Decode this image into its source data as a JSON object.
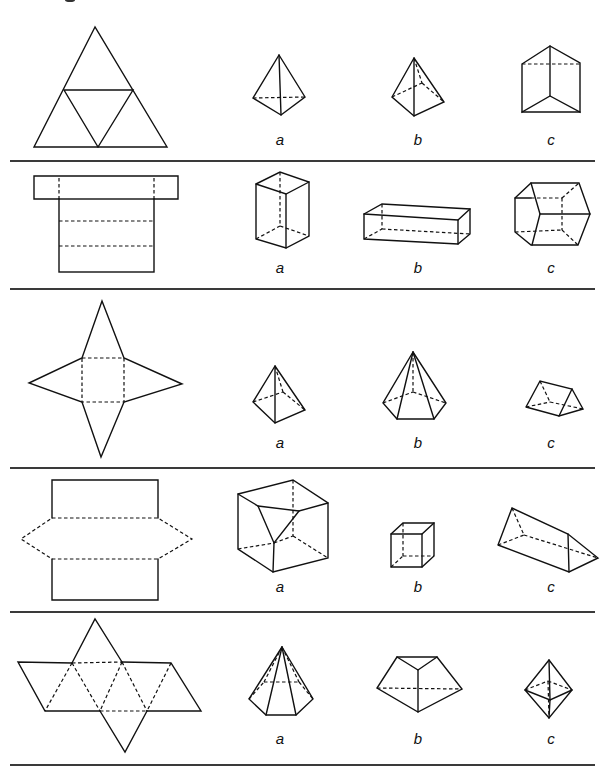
{
  "worksheet": {
    "instructions_partial": "",
    "option_labels": [
      "a",
      "b",
      "c"
    ],
    "rows": [
      {
        "net": "triangle-net-4-faces",
        "options": [
          {
            "label": "a",
            "shape": "triangular-pyramid"
          },
          {
            "label": "b",
            "shape": "square-pyramid"
          },
          {
            "label": "c",
            "shape": "triangular-prism"
          }
        ]
      },
      {
        "net": "cuboid-net-t-shape",
        "options": [
          {
            "label": "a",
            "shape": "tall-cuboid"
          },
          {
            "label": "b",
            "shape": "long-cuboid"
          },
          {
            "label": "c",
            "shape": "hexagonal-prism"
          }
        ]
      },
      {
        "net": "star-net-square-base",
        "options": [
          {
            "label": "a",
            "shape": "square-pyramid"
          },
          {
            "label": "b",
            "shape": "pentagonal-pyramid"
          },
          {
            "label": "c",
            "shape": "triangular-prism"
          }
        ]
      },
      {
        "net": "hexagon-with-two-rectangles",
        "options": [
          {
            "label": "a",
            "shape": "truncated-cube"
          },
          {
            "label": "b",
            "shape": "cube"
          },
          {
            "label": "c",
            "shape": "triangular-prism"
          }
        ]
      },
      {
        "net": "octahedron-net",
        "options": [
          {
            "label": "a",
            "shape": "hexagonal-pyramid"
          },
          {
            "label": "b",
            "shape": "pentagonal-wedge"
          },
          {
            "label": "c",
            "shape": "octahedron"
          }
        ]
      }
    ]
  }
}
